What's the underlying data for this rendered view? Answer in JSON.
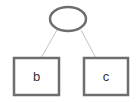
{
  "diagram": {
    "type": "tree",
    "root": {
      "id": "root",
      "shape": "ellipse",
      "label": ""
    },
    "children": [
      {
        "id": "b",
        "shape": "rect",
        "label": "b"
      },
      {
        "id": "c",
        "shape": "rect",
        "label": "c"
      }
    ],
    "edges": [
      {
        "from": "root",
        "to": "b"
      },
      {
        "from": "root",
        "to": "c"
      }
    ],
    "colors": {
      "shape_stroke": "#6e6e6e",
      "edge_stroke": "#c4c4c4",
      "background": "#ffffff",
      "text": "#333333"
    }
  }
}
